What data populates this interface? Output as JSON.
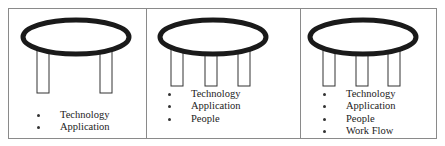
{
  "diagram": {
    "panels": [
      {
        "id": "two-legs",
        "legs": 2,
        "items": [
          "Technology",
          "Application"
        ]
      },
      {
        "id": "three-legs",
        "legs": 3,
        "items": [
          "Technology",
          "Application",
          "People"
        ]
      },
      {
        "id": "three-legs-workflow",
        "legs": 3,
        "items": [
          "Technology",
          "Application",
          "People",
          "Work Flow"
        ]
      }
    ],
    "colors": {
      "stroke": "#1a1a1a",
      "border": "#8a8a8a",
      "text": "#222222"
    }
  }
}
